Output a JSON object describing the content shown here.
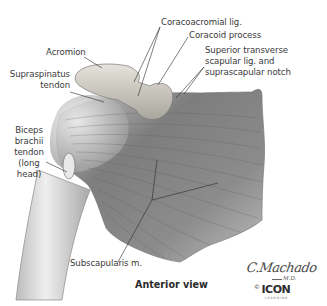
{
  "figure": {
    "caption": "Anterior view",
    "labels": {
      "coracoacromial_lig": "Coracoacromial lig.",
      "coracoid_process": "Coracoid process",
      "superior_transverse_1": "Superior transverse",
      "superior_transverse_2": "scapular lig. and",
      "superior_transverse_3": "suprascapular notch",
      "acromion": "Acromion",
      "supraspinatus_1": "Supraspinatus",
      "supraspinatus_2": "tendon",
      "biceps_1": "Biceps",
      "biceps_2": "brachii",
      "biceps_3": "tendon",
      "biceps_4": "(long",
      "biceps_5": "head)",
      "subscapularis": "Subscapularis m."
    },
    "signature": {
      "name": "C.Machado",
      "suffix": "M.D.",
      "copyright": "©",
      "publisher": "ICON",
      "publisher_sub": "LEARNING"
    }
  }
}
